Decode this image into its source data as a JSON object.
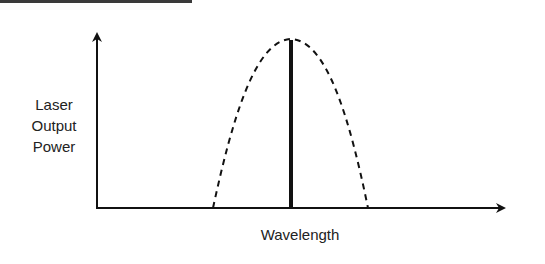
{
  "diagram": {
    "y_axis_label_lines": [
      "Laser",
      "Output",
      "Power"
    ],
    "x_axis_label": "Wavelength",
    "elements": {
      "gain_curve": "dashed parabolic envelope",
      "laser_line": "single thick vertical spectral line at peak"
    },
    "colors": {
      "stroke": "#111111",
      "text": "#222222",
      "topbar": "#3a3a3a"
    }
  }
}
